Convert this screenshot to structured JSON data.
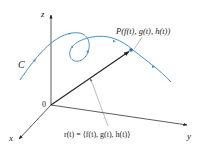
{
  "diagram": {
    "axes": {
      "z_label": "z",
      "x_label": "x",
      "y_label": "y",
      "origin_label": "0"
    },
    "curve": {
      "label": "C",
      "color": "#4a90c8"
    },
    "point": {
      "label": "P(f(t), g(t), h(t))"
    },
    "vector": {
      "label": "r(t) = ⟨f(t), g(t), h(t)⟩",
      "color": "#222222"
    }
  }
}
